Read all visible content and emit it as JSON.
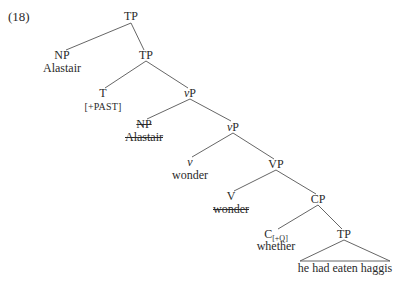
{
  "example_number": "(18)",
  "nodes": {
    "root_tp": "TP",
    "np": "NP",
    "np_word": "Alastair",
    "tp2": "TP",
    "t": "T",
    "t_feature": "[+PAST]",
    "vp1_v": "v",
    "vp1_p": "P",
    "np_copy": "NP",
    "np_copy_word": "Alastair",
    "vp2_v": "v",
    "vp2_p": "P",
    "little_v": "v",
    "little_v_word": "wonder",
    "vp": "VP",
    "v": "V",
    "v_copy_word": "wonder",
    "cp": "CP",
    "c": "C",
    "c_feature": "[+Q]",
    "c_word": "whether",
    "tp3": "TP",
    "tp3_words": "he had eaten haggis"
  }
}
